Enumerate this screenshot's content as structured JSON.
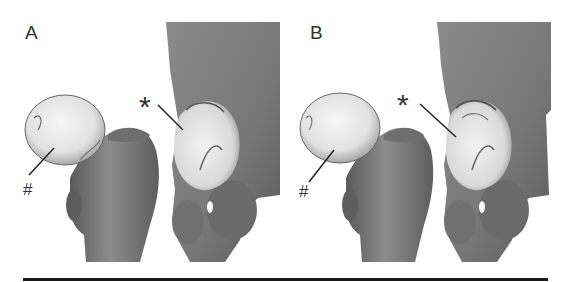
{
  "figure": {
    "panels": [
      {
        "label": "A",
        "annotations": {
          "femoral_head_marker": "#",
          "acetabulum_marker": "*"
        }
      },
      {
        "label": "B",
        "annotations": {
          "femoral_head_marker": "#",
          "acetabulum_marker": "*"
        }
      }
    ],
    "colors": {
      "bone": "#7a7a7a",
      "bone_dark": "#4a4a4a",
      "cartilage": "#ececec",
      "divider": "#1a1a1a",
      "background": "#ffffff"
    }
  }
}
